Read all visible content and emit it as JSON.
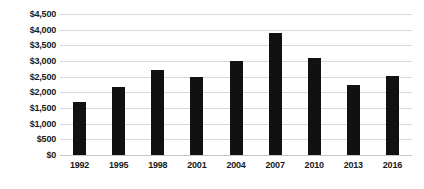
{
  "chart_data": {
    "type": "bar",
    "title": "",
    "subtitle": "",
    "xlabel": "",
    "ylabel": "",
    "categories": [
      "1992",
      "1995",
      "1998",
      "2001",
      "2004",
      "2007",
      "2010",
      "2013",
      "2016"
    ],
    "values": [
      1700,
      2180,
      2700,
      2480,
      3010,
      3900,
      3100,
      2250,
      2520
    ],
    "series": [
      {
        "name": "",
        "values": [
          1700,
          2180,
          2700,
          2480,
          3010,
          3900,
          3100,
          2250,
          2520
        ]
      }
    ],
    "ylim": [
      0,
      4500
    ],
    "ytick_values": [
      0,
      500,
      1000,
      1500,
      2000,
      2500,
      3000,
      3500,
      4000,
      4500
    ],
    "ytick_labels": [
      "$0",
      "$500",
      "$1,000",
      "$1,500",
      "$2,000",
      "$2,500",
      "$3,000",
      "$3,500",
      "$4,000",
      "$4,500"
    ],
    "xtick_labels": [
      "1992",
      "1995",
      "1998",
      "2001",
      "2004",
      "2007",
      "2010",
      "2013",
      "2016"
    ],
    "grid": true,
    "grid_axis": "y",
    "legend": false,
    "legend_position": "none",
    "annotations": [],
    "bar_color": "#111111",
    "grid_color": "#d9d9d9",
    "background_color": "#ffffff",
    "text_color": "#1a1a1a"
  }
}
